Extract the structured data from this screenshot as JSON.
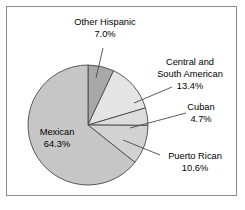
{
  "chart_data": {
    "type": "pie",
    "title": "",
    "subtitle": "",
    "xlabel": "",
    "ylabel": "",
    "legend_position": "none",
    "grid": false,
    "labels_show_percent": true,
    "categories": [
      "Other Hispanic",
      "Central and South American",
      "Cuban",
      "Puerto Rican",
      "Mexican"
    ],
    "values": [
      7.0,
      13.4,
      4.7,
      10.6,
      64.3
    ],
    "value_labels": [
      "7.0%",
      "13.4%",
      "4.7%",
      "10.6%",
      "64.3%"
    ],
    "units": "percent",
    "total": 100.0,
    "start_angle_deg": 0,
    "direction": "clockwise",
    "slices": [
      {
        "name": "Other Hispanic",
        "value": 7.0,
        "label": "Other Hispanic",
        "percent_label": "7.0%",
        "color": "#a8a8a8",
        "label_placement": "outside-top",
        "label_line1": "Other Hispanic",
        "label_line2": "7.0%"
      },
      {
        "name": "Central and South American",
        "value": 13.4,
        "label": "Central and South American",
        "percent_label": "13.4%",
        "color": "#e4e4e4",
        "label_placement": "outside-right",
        "label_line1": "Central and",
        "label_line2": "South American",
        "label_line3": "13.4%"
      },
      {
        "name": "Cuban",
        "value": 4.7,
        "label": "Cuban",
        "percent_label": "4.7%",
        "color": "#dcdcdc",
        "label_placement": "outside-right",
        "label_line1": "Cuban",
        "label_line2": "4.7%"
      },
      {
        "name": "Puerto Rican",
        "value": 10.6,
        "label": "Puerto Rican",
        "percent_label": "10.6%",
        "color": "#d2d2d2",
        "label_placement": "outside-right",
        "label_line1": "Puerto Rican",
        "label_line2": "10.6%"
      },
      {
        "name": "Mexican",
        "value": 64.3,
        "label": "Mexican",
        "percent_label": "64.3%",
        "color": "#c6c6c6",
        "label_placement": "inside",
        "label_line1": "Mexican",
        "label_line2": "64.3%"
      }
    ],
    "colors": {
      "outline": "#4a4a4a",
      "frame": "#8b8b8b",
      "background": "#ffffff",
      "text": "#000000"
    }
  }
}
